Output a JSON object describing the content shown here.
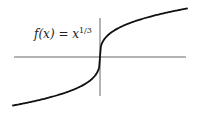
{
  "chart_data": {
    "type": "line",
    "title": "",
    "annotation": "f(x) = x^{1/3}",
    "function": "x^(1/3)",
    "xlabel": "",
    "ylabel": "",
    "grid": false,
    "legend": null,
    "xlim": [
      -1,
      1
    ],
    "ylim": [
      -1,
      1
    ],
    "axes_color": "#666666",
    "curve_color": "#111111",
    "x": [
      -1.0,
      -0.75,
      -0.5,
      -0.3,
      -0.15,
      -0.05,
      -0.01,
      0.0,
      0.01,
      0.05,
      0.15,
      0.3,
      0.5,
      0.75,
      1.0
    ],
    "y": [
      -1.0,
      -0.909,
      -0.794,
      -0.669,
      -0.531,
      -0.368,
      -0.215,
      0.0,
      0.215,
      0.368,
      0.531,
      0.669,
      0.794,
      0.909,
      1.0
    ]
  },
  "label": {
    "base": "f(x) = x",
    "exponent": "1/3"
  }
}
